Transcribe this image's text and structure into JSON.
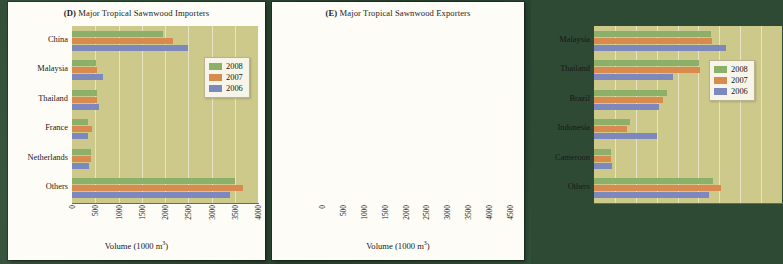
{
  "page": {
    "background_color": "#2c4733"
  },
  "panels": [
    {
      "key": "d",
      "label": "(D)",
      "title": " Major Tropical Sawnwood Importers",
      "axis_title": "Volume (1000 m",
      "axis_title_sup": "3",
      "axis_title_end": ")"
    },
    {
      "key": "e",
      "label": "(E)",
      "title": " Major Tropical Sawnwood Exporters",
      "axis_title": "Volume (1000 m",
      "axis_title_sup": "3",
      "axis_title_end": ")"
    }
  ],
  "legend": {
    "entries": [
      {
        "label": "2008",
        "color": "#8cb06a"
      },
      {
        "label": "2007",
        "color": "#d98a4e"
      },
      {
        "label": "2006",
        "color": "#7d89bd"
      }
    ]
  },
  "chart_data": [
    {
      "id": "chart-d",
      "type": "bar",
      "orientation": "horizontal",
      "title": "(D) Major Tropical Sawnwood Importers",
      "xlabel": "Volume (1000 m3)",
      "ylabel": "",
      "xlim": [
        0,
        4000
      ],
      "xticks": [
        0,
        500,
        1000,
        1500,
        2000,
        2500,
        3000,
        3500,
        4000
      ],
      "xtick_labels": [
        "0",
        "500",
        "1000",
        "1500",
        "2000",
        "2500",
        "3000",
        "3500",
        "4000"
      ],
      "grid": true,
      "legend_position": "upper right",
      "categories": [
        "China",
        "Malaysia",
        "Thailand",
        "France",
        "Netherlands",
        "Others"
      ],
      "series": [
        {
          "name": "2008",
          "color": "#8cb06a",
          "values": [
            1950,
            520,
            540,
            340,
            400,
            3500
          ]
        },
        {
          "name": "2007",
          "color": "#d98a4e",
          "values": [
            2170,
            530,
            545,
            430,
            400,
            3680
          ]
        },
        {
          "name": "2006",
          "color": "#7d89bd",
          "values": [
            2500,
            670,
            580,
            350,
            370,
            3400
          ]
        }
      ]
    },
    {
      "id": "chart-e",
      "type": "bar",
      "orientation": "horizontal",
      "title": "(E) Major Tropical Sawnwood Exporters",
      "xlabel": "Volume (1000 m3)",
      "ylabel": "",
      "xlim": [
        0,
        4500
      ],
      "xticks": [
        0,
        500,
        1000,
        1500,
        2000,
        2500,
        3000,
        3500,
        4000,
        4500
      ],
      "xtick_labels": [
        "0",
        "500",
        "1000",
        "1500",
        "2000",
        "2500",
        "3000",
        "3500",
        "4000",
        "4500"
      ],
      "grid": true,
      "legend_position": "upper right",
      "categories": [
        "Malaysia",
        "Thailand",
        "Brazil",
        "Indonesia",
        "Cameroon",
        "Others"
      ],
      "series": [
        {
          "name": "2008",
          "color": "#8cb06a",
          "values": [
            2800,
            2520,
            1750,
            850,
            400,
            2850
          ]
        },
        {
          "name": "2007",
          "color": "#d98a4e",
          "values": [
            2820,
            2530,
            1650,
            800,
            400,
            3050
          ]
        },
        {
          "name": "2006",
          "color": "#7d89bd",
          "values": [
            3150,
            1900,
            1550,
            1500,
            430,
            2750
          ]
        }
      ]
    }
  ]
}
